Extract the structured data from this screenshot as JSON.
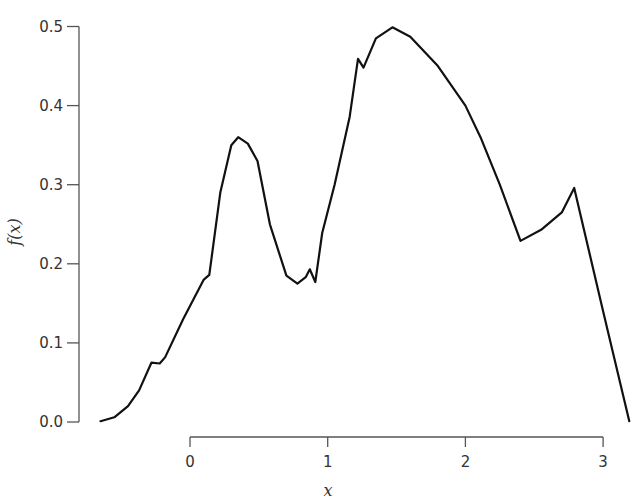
{
  "chart_data": {
    "type": "line",
    "title": "",
    "xlabel": "x",
    "ylabel": "f(x)",
    "xlim": [
      -0.65,
      3.2
    ],
    "ylim": [
      0.0,
      0.5
    ],
    "x_ticks": [
      0,
      1,
      2,
      3
    ],
    "x_tick_labels": [
      "0",
      "1",
      "2",
      "3"
    ],
    "y_ticks": [
      0.0,
      0.1,
      0.2,
      0.3,
      0.4,
      0.5
    ],
    "y_tick_labels": [
      "0.0",
      "0.1",
      "0.2",
      "0.3",
      "0.4",
      "0.5"
    ],
    "grid": false,
    "legend": null,
    "series": [
      {
        "name": "f(x)",
        "color": "#111111",
        "x": [
          -0.65,
          -0.55,
          -0.45,
          -0.37,
          -0.28,
          -0.22,
          -0.18,
          -0.05,
          0.1,
          0.14,
          0.22,
          0.3,
          0.35,
          0.42,
          0.49,
          0.58,
          0.7,
          0.78,
          0.84,
          0.87,
          0.91,
          0.96,
          1.05,
          1.16,
          1.22,
          1.26,
          1.35,
          1.47,
          1.6,
          1.8,
          2.0,
          2.11,
          2.25,
          2.4,
          2.55,
          2.7,
          2.79,
          3.0,
          3.19
        ],
        "y": [
          0.001,
          0.006,
          0.02,
          0.04,
          0.075,
          0.074,
          0.082,
          0.13,
          0.18,
          0.186,
          0.29,
          0.35,
          0.36,
          0.352,
          0.33,
          0.25,
          0.185,
          0.175,
          0.183,
          0.193,
          0.177,
          0.239,
          0.3,
          0.386,
          0.459,
          0.448,
          0.485,
          0.499,
          0.487,
          0.45,
          0.4,
          0.36,
          0.3,
          0.229,
          0.243,
          0.265,
          0.296,
          0.14,
          0.001
        ]
      }
    ]
  },
  "axes": {
    "xlabel": "x",
    "ylabel": "f(x)"
  }
}
